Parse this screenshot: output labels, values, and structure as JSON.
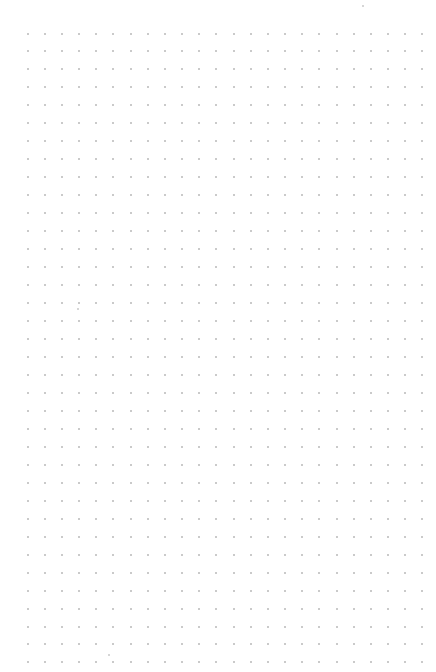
{
  "canvas": {
    "type": "dot-grid",
    "background": "#ffffff",
    "dot_color": "#b9b9b9",
    "dot_size": 2,
    "origin_x": 26.5,
    "origin_y": 32.5,
    "spacing_x": 17.17,
    "spacing_y": 17.97,
    "columns": 24,
    "rows": 36
  },
  "stray_marks": [
    {
      "x": 362,
      "y": 5
    },
    {
      "x": 77,
      "y": 308
    },
    {
      "x": 108,
      "y": 654
    }
  ]
}
